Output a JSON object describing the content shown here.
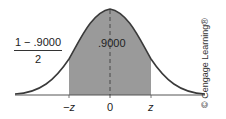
{
  "diagram": {
    "type": "normal-distribution",
    "shaded_area_label": ".9000",
    "tail_label": {
      "numerator": "1 − .9000",
      "denominator": "2"
    },
    "axis_ticks": {
      "neg_z": "−z",
      "zero": "0",
      "pos_z": "z"
    },
    "copyright": "© Cengage Learning®",
    "colors": {
      "shade": "#9a9a9a",
      "curve": "#3a3a3a",
      "axis": "#555555"
    }
  }
}
